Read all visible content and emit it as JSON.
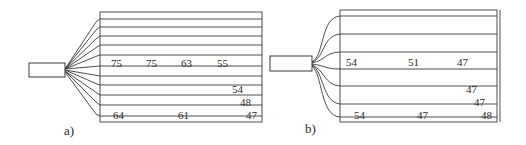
{
  "figure": {
    "panels": [
      {
        "id": "a",
        "label": "a)",
        "line_count": 11,
        "values": {
          "row_center": [
            "75",
            "75",
            "63",
            "55"
          ],
          "row_lower_1": [
            "54"
          ],
          "row_lower_2": [
            "48"
          ],
          "row_bottom": [
            "64",
            "61",
            "47"
          ]
        }
      },
      {
        "id": "b",
        "label": "b)",
        "line_count": 7,
        "values": {
          "row_center": [
            "54",
            "51",
            "47"
          ],
          "row_lower_1": [
            "47"
          ],
          "row_lower_2": [
            "47"
          ],
          "row_bottom": [
            "54",
            "47",
            "48"
          ]
        }
      }
    ]
  },
  "colors": {
    "stroke": "#3a3a3a",
    "text": "#2a2a2a",
    "background": "#ffffff"
  }
}
